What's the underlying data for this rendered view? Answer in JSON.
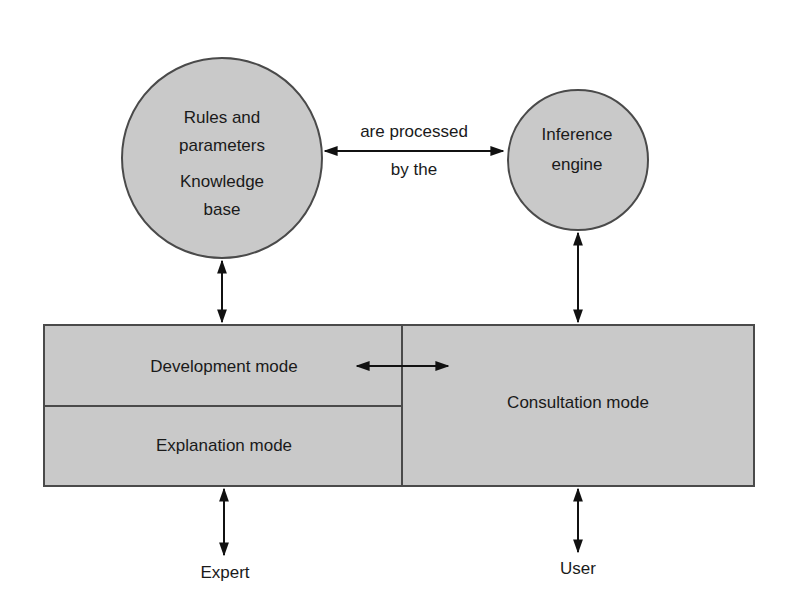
{
  "diagram": {
    "type": "expert-system-architecture",
    "colors": {
      "fill": "#c9c9c9",
      "stroke": "#4a4a4a",
      "arrow": "#111111",
      "text": "#1a1a1a",
      "background": "#ffffff"
    },
    "nodes": {
      "knowledge_base": {
        "line1": "Rules and",
        "line2": "parameters",
        "line3": "Knowledge",
        "line4": "base"
      },
      "inference_engine": {
        "line1": "Inference",
        "line2": "engine"
      },
      "development_mode": {
        "label": "Development mode"
      },
      "explanation_mode": {
        "label": "Explanation mode"
      },
      "consultation_mode": {
        "label": "Consultation mode"
      },
      "expert": {
        "label": "Expert"
      },
      "user": {
        "label": "User"
      }
    },
    "edges": {
      "kb_to_engine": {
        "label_top": "are processed",
        "label_bottom": "by the",
        "direction": "bidirectional"
      },
      "kb_to_development": {
        "direction": "bidirectional"
      },
      "engine_to_consultation": {
        "direction": "bidirectional"
      },
      "development_to_consultation": {
        "direction": "bidirectional"
      },
      "expert_to_explanation": {
        "direction": "bidirectional"
      },
      "user_to_consultation": {
        "direction": "bidirectional"
      }
    }
  }
}
